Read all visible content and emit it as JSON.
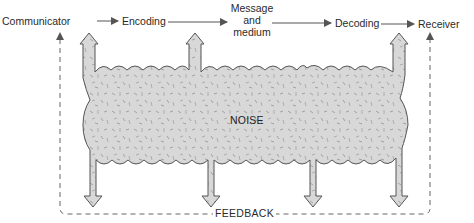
{
  "diagram": {
    "nodes": [
      {
        "id": "communicator",
        "label": "Communicator"
      },
      {
        "id": "encoding",
        "label": "Encoding"
      },
      {
        "id": "message",
        "label_lines": [
          "Message",
          "and",
          "medium"
        ]
      },
      {
        "id": "decoding",
        "label": "Decoding"
      },
      {
        "id": "receiver",
        "label": "Receiver"
      }
    ],
    "edges": [
      {
        "from": "communicator",
        "to": "encoding"
      },
      {
        "from": "encoding",
        "to": "message"
      },
      {
        "from": "message",
        "to": "decoding"
      },
      {
        "from": "decoding",
        "to": "receiver"
      }
    ],
    "noise": {
      "label": "NOISE",
      "fill": "#d9d9d9",
      "outline": "#555555",
      "arrow_count_up": 4,
      "arrow_count_down": 4
    },
    "feedback": {
      "label": "FEEDBACK",
      "style": "dashed",
      "from": "receiver",
      "to": "communicator"
    }
  },
  "colors": {
    "text": "#2a2a2a",
    "arrow": "#555555",
    "noise_fill": "#d9d9d9",
    "dash": "#666666"
  }
}
